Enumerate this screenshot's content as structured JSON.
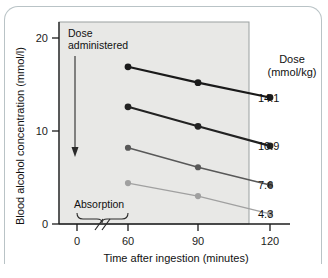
{
  "chart_data": {
    "type": "line",
    "title": "",
    "xlabel": "Time after ingestion (minutes)",
    "ylabel": "Blood alcohol concentration (mmol/l)",
    "x": [
      60,
      90,
      120
    ],
    "xticks": [
      "0",
      "60",
      "90",
      "120"
    ],
    "yticks": [
      "0",
      "10",
      "20"
    ],
    "xlim": [
      0,
      130
    ],
    "ylim": [
      0,
      21
    ],
    "grid": false,
    "legend_position": "right",
    "legend_title_line1": "Dose",
    "legend_title_line2": "(mmol/kg)",
    "axis_break": true,
    "series": [
      {
        "name": "14.1",
        "label": "14.1",
        "color": "#1a1a1a",
        "width": 2.1,
        "values": [
          16.9,
          15.2,
          13.6
        ]
      },
      {
        "name": "10.9",
        "label": "10.9",
        "color": "#222222",
        "width": 2.1,
        "values": [
          12.6,
          10.5,
          8.4
        ]
      },
      {
        "name": "7.6",
        "label": "7.6",
        "color": "#585858",
        "width": 1.5,
        "values": [
          8.2,
          6.1,
          4.2
        ]
      },
      {
        "name": "4.3",
        "label": "4.3",
        "color": "#a0a0a0",
        "width": 1.3,
        "values": [
          4.4,
          3.0,
          1.1
        ]
      }
    ],
    "annotations": [
      {
        "name": "dose-administered",
        "line1": "Dose",
        "line2": "administered"
      },
      {
        "name": "absorption",
        "text": "Absorption"
      }
    ]
  },
  "colors": {
    "plot_background": "#e8e8e6",
    "plot_border": "#9aa0a0",
    "axis": "#1c1c1c",
    "card_border": "#b9c3c6"
  }
}
